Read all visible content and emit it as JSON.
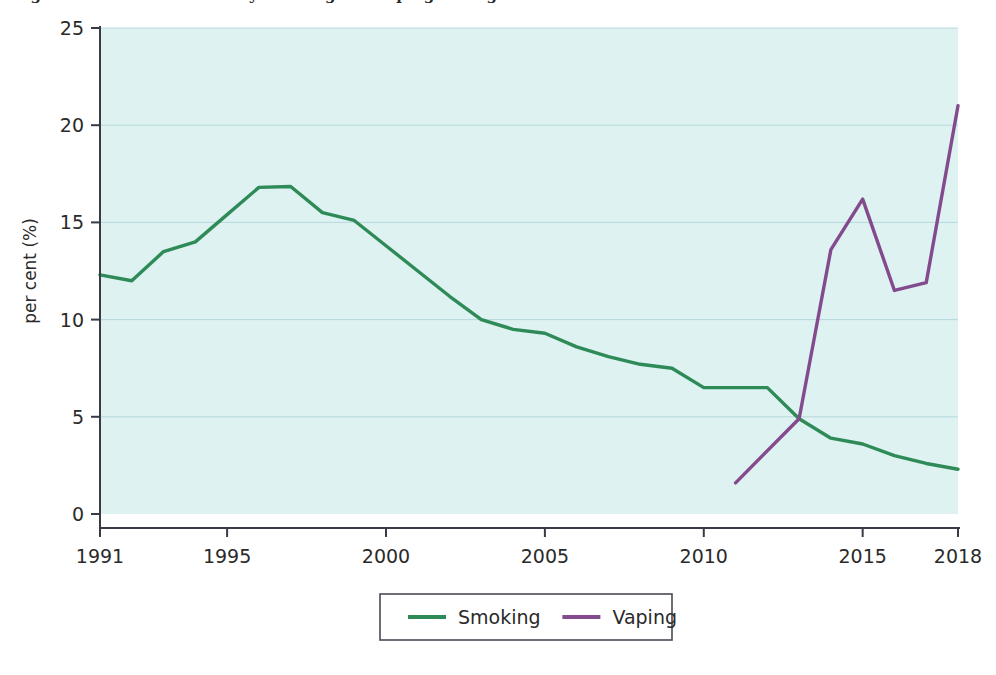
{
  "figure": {
    "clipped_title_fragment": "Figure 1: Prevalence of daily smoking and vaping among adults",
    "background_color": "#ffffff"
  },
  "chart_data": {
    "type": "line",
    "title": "",
    "xlabel": "",
    "ylabel": "per cent (%)",
    "xlim": [
      1991,
      2018
    ],
    "ylim": [
      0,
      25
    ],
    "yticks": [
      0,
      5,
      10,
      15,
      20,
      25
    ],
    "ytick_labels": [
      "0",
      "5",
      "10",
      "15",
      "20",
      "25"
    ],
    "xticks": [
      1991,
      1995,
      2000,
      2005,
      2010,
      2015,
      2018
    ],
    "xtick_labels": [
      "1991",
      "1995",
      "2000",
      "2005",
      "2010",
      "2015",
      "2018"
    ],
    "grid": "horizontal",
    "legend_position": "bottom-center",
    "plot_background_color": "#ddf2f1",
    "grid_color": "#aacfd4",
    "series": [
      {
        "name": "Smoking",
        "color": "#2e8b57",
        "x": [
          1991,
          1992,
          1993,
          1994,
          1995,
          1996,
          1997,
          1998,
          1999,
          2000,
          2001,
          2002,
          2003,
          2004,
          2005,
          2006,
          2007,
          2008,
          2009,
          2010,
          2011,
          2012,
          2013,
          2014,
          2015,
          2016,
          2017,
          2018
        ],
        "values": [
          12.3,
          12.0,
          13.5,
          14.0,
          15.4,
          16.8,
          16.85,
          15.5,
          15.1,
          13.8,
          12.5,
          11.2,
          10.0,
          9.5,
          9.3,
          8.6,
          8.1,
          7.7,
          7.5,
          6.5,
          6.5,
          6.5,
          4.9,
          3.9,
          3.6,
          3.0,
          2.6,
          2.3
        ]
      },
      {
        "name": "Vaping",
        "color": "#834a8e",
        "x": [
          2011,
          2013,
          2014,
          2015,
          2016,
          2017,
          2018
        ],
        "values": [
          1.6,
          4.9,
          13.6,
          16.2,
          11.5,
          11.9,
          21.0
        ]
      }
    ]
  },
  "legend": {
    "entries": [
      {
        "label": "Smoking",
        "color": "#2e8b57"
      },
      {
        "label": "Vaping",
        "color": "#834a8e"
      }
    ],
    "border_color": "#4a4a55",
    "background_color": "#ffffff"
  },
  "axes": {
    "y_axis_title": "per cent (%)",
    "axis_line_color": "#3a3a44"
  }
}
